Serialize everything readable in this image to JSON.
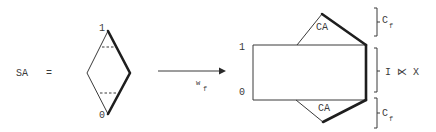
{
  "left": {
    "label": "SA",
    "equals": "=",
    "vertex_top_label": "1",
    "vertex_bottom_label": "0"
  },
  "arrow": {
    "label_main": "w",
    "label_sub": "f"
  },
  "right": {
    "rect_top_label": "1",
    "rect_bottom_label": "0",
    "top_triangle_label": "CA",
    "bottom_triangle_label": "CA"
  },
  "braces": {
    "top": {
      "main": "C",
      "sub": "f"
    },
    "middle": {
      "text": "I ⋉ X"
    },
    "bottom": {
      "main": "C",
      "sub": "f"
    }
  }
}
